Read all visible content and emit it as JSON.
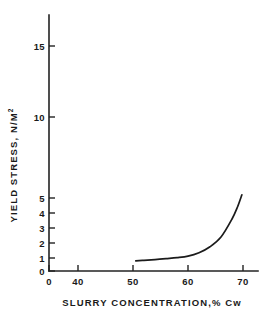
{
  "chart_data": {
    "type": "line",
    "title": "",
    "xlabel": "SLURRY CONCENTRATION,% Cw",
    "ylabel": "YIELD STRESS, N/M",
    "ylabel_superscript": "2",
    "grid": false,
    "legend": null,
    "xlim": [
      0,
      70
    ],
    "ylim": [
      0,
      17
    ],
    "x_broken_axis": true,
    "x_break_between": [
      0,
      40
    ],
    "xticks": [
      0,
      40,
      50,
      60,
      70
    ],
    "xticklabels": [
      "0",
      "40",
      "50",
      "60",
      "70"
    ],
    "yticks": [
      0,
      1,
      2,
      3,
      4,
      5,
      10,
      15
    ],
    "yticklabels": [
      "0",
      "1",
      "2",
      "3",
      "4",
      "5",
      "10",
      "15"
    ],
    "y_scale_note": "compressed above 5 (quasi-log spacing)",
    "series": [
      {
        "name": "yield stress vs slurry concentration",
        "x": [
          50.5,
          52,
          54,
          56,
          58,
          60,
          62,
          64,
          66,
          68,
          69,
          69.8
        ],
        "y": [
          0.78,
          0.82,
          0.88,
          0.95,
          1.02,
          1.12,
          1.35,
          1.75,
          2.4,
          3.6,
          4.4,
          5.2
        ]
      }
    ]
  },
  "axis": {
    "y_title_main": "YIELD  STRESS,  N/M",
    "y_title_sup": "2",
    "x_title": "SLURRY  CONCENTRATION,% Cw"
  },
  "colors": {
    "curve": "#1b1b1b",
    "axis": "#222222",
    "background": "#ffffff",
    "text": "#1a1a1a"
  }
}
